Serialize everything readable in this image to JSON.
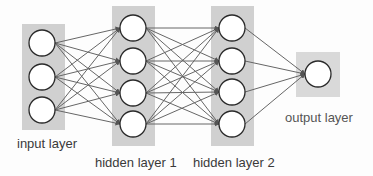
{
  "diagram": {
    "type": "feed-forward neural network",
    "colors": {
      "layer_box": "#d0d0d0",
      "output_box": "#d9d9d9",
      "node_fill": "#ffffff",
      "node_stroke": "#2a2a2a",
      "edge": "#666666",
      "label": "#3a3a3a"
    },
    "layers": [
      {
        "id": "input",
        "label": "input layer",
        "box": {
          "x": 22,
          "y": 24,
          "w": 43,
          "h": 106
        },
        "nodes": [
          {
            "cx": 42,
            "cy": 43
          },
          {
            "cx": 42,
            "cy": 77
          },
          {
            "cx": 42,
            "cy": 110
          }
        ],
        "label_pos": {
          "x": 17,
          "y": 137
        }
      },
      {
        "id": "hidden1",
        "label": "hidden layer 1",
        "box": {
          "x": 112,
          "y": 6,
          "w": 43,
          "h": 140
        },
        "nodes": [
          {
            "cx": 133,
            "cy": 28
          },
          {
            "cx": 133,
            "cy": 61
          },
          {
            "cx": 133,
            "cy": 93
          },
          {
            "cx": 133,
            "cy": 124
          }
        ],
        "label_pos": {
          "x": 95,
          "y": 156
        }
      },
      {
        "id": "hidden2",
        "label": "hidden layer 2",
        "box": {
          "x": 211,
          "y": 6,
          "w": 43,
          "h": 140
        },
        "nodes": [
          {
            "cx": 232,
            "cy": 28
          },
          {
            "cx": 232,
            "cy": 61
          },
          {
            "cx": 232,
            "cy": 92
          },
          {
            "cx": 232,
            "cy": 124
          }
        ],
        "label_pos": {
          "x": 193,
          "y": 156
        }
      },
      {
        "id": "output",
        "label": "output layer",
        "box": {
          "x": 296,
          "y": 52,
          "w": 44,
          "h": 45
        },
        "nodes": [
          {
            "cx": 318,
            "cy": 74
          }
        ],
        "label_pos": {
          "x": 285,
          "y": 111
        }
      }
    ],
    "node_radius": 13,
    "connectivity": "fully-connected between consecutive layers, arrows pointing right"
  }
}
